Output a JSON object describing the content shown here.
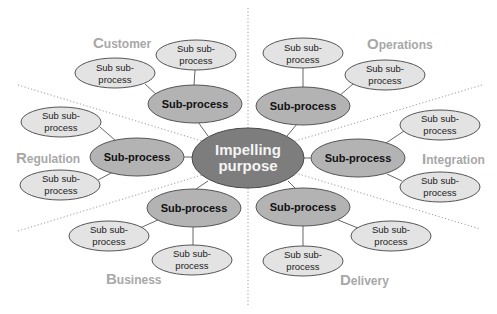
{
  "center": {
    "line1": "Impelling",
    "line2": "purpose"
  },
  "colors": {
    "center_fill": "#7d7d7d",
    "sub_fill": "#b3b3b3",
    "subsub_fill": "#e3e3e3",
    "category_label": "#a8a8a8"
  },
  "categories": [
    {
      "key": "customer",
      "cap": "C",
      "rest": "ustomer",
      "sub": "Sub-process",
      "children": [
        {
          "l1": "Sub sub-",
          "l2": "process"
        },
        {
          "l1": "Sub sub-",
          "l2": "process"
        }
      ]
    },
    {
      "key": "operations",
      "cap": "O",
      "rest": "perations",
      "sub": "Sub-process",
      "children": [
        {
          "l1": "Sub sub-",
          "l2": "process"
        },
        {
          "l1": "Sub sub-",
          "l2": "process"
        }
      ]
    },
    {
      "key": "regulation",
      "cap": "R",
      "rest": "egulation",
      "sub": "Sub-process",
      "children": [
        {
          "l1": "Sub sub-",
          "l2": "process"
        },
        {
          "l1": "Sub sub-",
          "l2": "process"
        }
      ]
    },
    {
      "key": "integration",
      "cap": "I",
      "rest": "ntegration",
      "sub": "Sub-process",
      "children": [
        {
          "l1": "Sub sub-",
          "l2": "process"
        },
        {
          "l1": "Sub sub-",
          "l2": "process"
        }
      ]
    },
    {
      "key": "business",
      "cap": "B",
      "rest": "usiness",
      "sub": "Sub-process",
      "children": [
        {
          "l1": "Sub sub-",
          "l2": "process"
        },
        {
          "l1": "Sub sub-",
          "l2": "process"
        }
      ]
    },
    {
      "key": "delivery",
      "cap": "D",
      "rest": "elivery",
      "sub": "Sub-process",
      "children": [
        {
          "l1": "Sub sub-",
          "l2": "process"
        },
        {
          "l1": "Sub sub-",
          "l2": "process"
        }
      ]
    }
  ]
}
